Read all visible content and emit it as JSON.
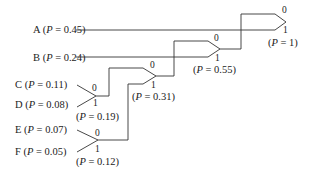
{
  "diagram": {
    "type": "huffman-coding-tree",
    "symbols": [
      {
        "id": "A",
        "label": "A",
        "p_text": "0.45",
        "p": 0.45
      },
      {
        "id": "B",
        "label": "B",
        "p_text": "0.24",
        "p": 0.24
      },
      {
        "id": "C",
        "label": "C",
        "p_text": "0.11",
        "p": 0.11
      },
      {
        "id": "D",
        "label": "D",
        "p_text": "0.08",
        "p": 0.08
      },
      {
        "id": "E",
        "label": "E",
        "p_text": "0.07",
        "p": 0.07
      },
      {
        "id": "F",
        "label": "F",
        "p_text": "0.05",
        "p": 0.05
      }
    ],
    "merges": [
      {
        "id": "CD",
        "inputs": [
          "C",
          "D"
        ],
        "bit_top": "0",
        "bit_bottom": "1",
        "p_text": "0.19"
      },
      {
        "id": "EF",
        "inputs": [
          "E",
          "F"
        ],
        "bit_top": "0",
        "bit_bottom": "1",
        "p_text": "0.12"
      },
      {
        "id": "CDEF",
        "inputs": [
          "CD",
          "EF"
        ],
        "bit_top": "0",
        "bit_bottom": "1",
        "p_text": "0.31"
      },
      {
        "id": "BCDEF",
        "inputs": [
          "CDEF",
          "B"
        ],
        "bit_top": "0",
        "bit_bottom": "1",
        "p_text": "0.55"
      },
      {
        "id": "ROOT",
        "inputs": [
          "BCDEF",
          "A"
        ],
        "bit_top": "0",
        "bit_bottom": "1",
        "p_text": "1"
      }
    ],
    "p_symbol": "P",
    "equals": " = "
  }
}
